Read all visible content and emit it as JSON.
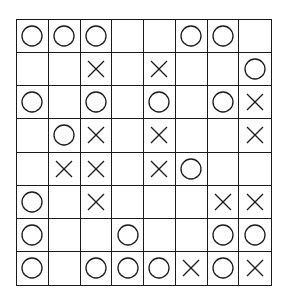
{
  "game": {
    "type": "tic-tac-toe-grid",
    "rows": 8,
    "cols": 8,
    "colors": {
      "line": "#1a1a1a",
      "background": "#ffffff",
      "mark": "#1a1a1a"
    },
    "board": [
      [
        "O",
        "O",
        "O",
        "",
        "",
        "O",
        "O",
        ""
      ],
      [
        "",
        "",
        "X",
        "",
        "X",
        "",
        "",
        "O"
      ],
      [
        "O",
        "",
        "O",
        "",
        "O",
        "",
        "O",
        "X"
      ],
      [
        "",
        "O",
        "X",
        "",
        "X",
        "",
        "",
        "X"
      ],
      [
        "",
        "X",
        "X",
        "",
        "X",
        "O",
        "",
        ""
      ],
      [
        "O",
        "",
        "X",
        "",
        "",
        "",
        "X",
        "X"
      ],
      [
        "O",
        "",
        "",
        "O",
        "",
        "",
        "O",
        "O"
      ],
      [
        "O",
        "",
        "O",
        "O",
        "O",
        "X",
        "O",
        "X"
      ]
    ]
  }
}
